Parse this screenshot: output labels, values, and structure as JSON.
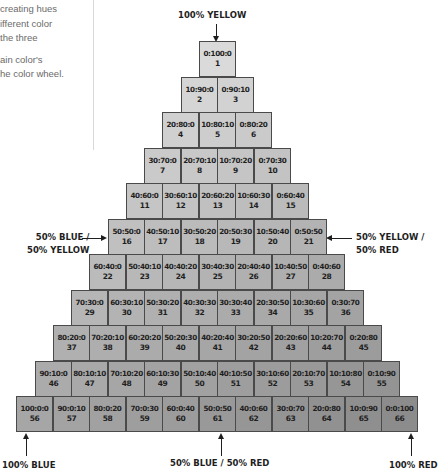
{
  "intro": {
    "lines": [
      "creating hues",
      "ifferent color",
      " the three",
      "ain color's",
      "he color wheel."
    ]
  },
  "labels": {
    "top": "100% YELLOW",
    "left_mid_line1": "50% BLUE /",
    "left_mid_line2": "50% YELLOW",
    "right_mid_line1": "50% YELLOW /",
    "right_mid_line2": "50% RED",
    "bottom_left": "100% BLUE",
    "bottom_mid": "50% BLUE / 50% RED",
    "bottom_right": "100% RED"
  },
  "colors": {
    "cell_top": "#dadada",
    "cell_bottom_left": "#a6a6a6",
    "cell_bottom_right": "#8c8c8c",
    "border": "#4a4a4a",
    "text": "#1e1e1e"
  },
  "rows": [
    [
      [
        "0:100:0",
        "1"
      ]
    ],
    [
      [
        "10:90:0",
        "2"
      ],
      [
        "0:90:10",
        "3"
      ]
    ],
    [
      [
        "20:80:0",
        "4"
      ],
      [
        "10:80:10",
        "5"
      ],
      [
        "0:80:20",
        "6"
      ]
    ],
    [
      [
        "30:70:0",
        "7"
      ],
      [
        "20:70:10",
        "8"
      ],
      [
        "10:70:20",
        "9"
      ],
      [
        "0:70:30",
        "10"
      ]
    ],
    [
      [
        "40:60:0",
        "11"
      ],
      [
        "30:60:10",
        "12"
      ],
      [
        "20:60:20",
        "13"
      ],
      [
        "10:60:30",
        "14"
      ],
      [
        "0:60:40",
        "15"
      ]
    ],
    [
      [
        "50:50:0",
        "16"
      ],
      [
        "40:50:10",
        "17"
      ],
      [
        "30:50:20",
        "18"
      ],
      [
        "20:50:30",
        "19"
      ],
      [
        "10:50:40",
        "20"
      ],
      [
        "0:50:50",
        "21"
      ]
    ],
    [
      [
        "60:40:0",
        "22"
      ],
      [
        "50:40:10",
        "23"
      ],
      [
        "40:40:20",
        "24"
      ],
      [
        "30:40:30",
        "25"
      ],
      [
        "20:40:40",
        "26"
      ],
      [
        "10:40:50",
        "27"
      ],
      [
        "0:40:60",
        "28"
      ]
    ],
    [
      [
        "70:30:0",
        "29"
      ],
      [
        "60:30:10",
        "30"
      ],
      [
        "50:30:20",
        "31"
      ],
      [
        "40:30:30",
        "32"
      ],
      [
        "30:30:40",
        "33"
      ],
      [
        "20:30:50",
        "34"
      ],
      [
        "10:30:60",
        "35"
      ],
      [
        "0:30:70",
        "36"
      ]
    ],
    [
      [
        "80:20:0",
        "37"
      ],
      [
        "70:20:10",
        "38"
      ],
      [
        "60:20:20",
        "39"
      ],
      [
        "50:20:30",
        "40"
      ],
      [
        "40:20:40",
        "41"
      ],
      [
        "30:20:50",
        "42"
      ],
      [
        "20:20:60",
        "43"
      ],
      [
        "10:20:70",
        "44"
      ],
      [
        "0:20:80",
        "45"
      ]
    ],
    [
      [
        "90:10:0",
        "46"
      ],
      [
        "80:10:10",
        "47"
      ],
      [
        "70:10:20",
        "48"
      ],
      [
        "60:10:30",
        "49"
      ],
      [
        "50:10:40",
        "50"
      ],
      [
        "40:10:50",
        "51"
      ],
      [
        "30:10:60",
        "52"
      ],
      [
        "20:10:70",
        "53"
      ],
      [
        "10:10:80",
        "54"
      ],
      [
        "0:10:90",
        "55"
      ]
    ],
    [
      [
        "100:0:0",
        "56"
      ],
      [
        "90:0:10",
        "57"
      ],
      [
        "80:0:20",
        "58"
      ],
      [
        "70:0:30",
        "59"
      ],
      [
        "60:0:40",
        "60"
      ],
      [
        "50:0:50",
        "61"
      ],
      [
        "40:0:60",
        "62"
      ],
      [
        "30:0:70",
        "63"
      ],
      [
        "20:0:80",
        "64"
      ],
      [
        "10:0:90",
        "65"
      ],
      [
        "0:0:100",
        "66"
      ]
    ]
  ]
}
